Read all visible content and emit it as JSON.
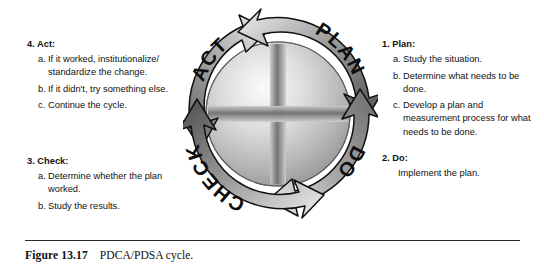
{
  "figure": {
    "caption_label": "Figure 13.17",
    "caption_text": "PDCA/PDSA cycle.",
    "rule_color": "#2b2b2b"
  },
  "cycle": {
    "segments": [
      {
        "id": "plan",
        "label": "PLAN",
        "position": "top-right"
      },
      {
        "id": "do",
        "label": "DO",
        "position": "bottom-right"
      },
      {
        "id": "check",
        "label": "CHECK",
        "position": "bottom-left"
      },
      {
        "id": "act",
        "label": "ACT",
        "position": "top-left"
      }
    ],
    "direction": "clockwise",
    "ring_dark": "#5a5a5a",
    "ring_light": "#e2e2e2",
    "sphere_light": "#f2f2f2",
    "sphere_mid": "#b9b9b9",
    "sphere_dark": "#8a8a8a",
    "cross_color": "#7e7e7e",
    "outline_color": "#1a1a1a"
  },
  "steps": {
    "plan": {
      "title": "1. Plan:",
      "items": [
        {
          "marker": "a.",
          "text": "Study the situation."
        },
        {
          "marker": "b.",
          "text": "Determine what needs to be done."
        },
        {
          "marker": "c.",
          "text": "Develop a plan and measurement process for what needs to be done."
        }
      ]
    },
    "do": {
      "title": "2. Do:",
      "plain_text": "Implement the plan."
    },
    "check": {
      "title": "3. Check:",
      "items": [
        {
          "marker": "a.",
          "text": "Determine whether the plan worked."
        },
        {
          "marker": "b.",
          "text": "Study the results."
        }
      ]
    },
    "act": {
      "title": "4. Act:",
      "items": [
        {
          "marker": "a.",
          "text": "If it worked, institutionalize/ standardize the change."
        },
        {
          "marker": "b.",
          "text": "If it didn't, try something else."
        },
        {
          "marker": "c.",
          "text": "Continue the cycle."
        }
      ]
    }
  }
}
